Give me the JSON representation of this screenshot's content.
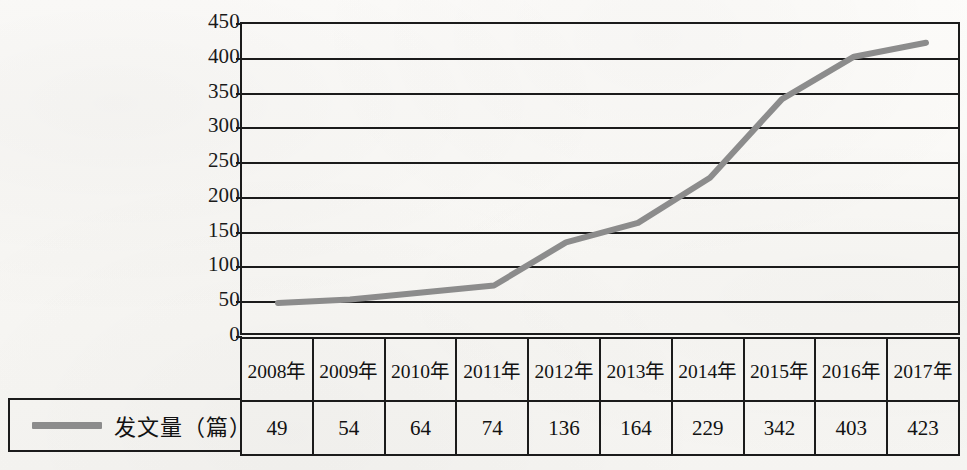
{
  "chart_data": {
    "type": "line",
    "title": "",
    "xlabel": "",
    "ylabel": "",
    "ylim": [
      0,
      450
    ],
    "ytick_step": 50,
    "grid": true,
    "legend_position": "bottom-left",
    "line_color": "#8c8c8c",
    "axis_color": "#1b1b1b",
    "series_name": "发文量（篇）",
    "categories": [
      "2008年",
      "2009年",
      "2010年",
      "2011年",
      "2012年",
      "2013年",
      "2014年",
      "2015年",
      "2016年",
      "2017年"
    ],
    "values": [
      49,
      54,
      64,
      74,
      136,
      164,
      229,
      342,
      403,
      423
    ],
    "yticks": [
      "450",
      "400",
      "350",
      "300",
      "250",
      "200",
      "150",
      "100",
      "50",
      "0"
    ],
    "series": [
      {
        "name": "发文量（篇）",
        "values": [
          49,
          54,
          64,
          74,
          136,
          164,
          229,
          342,
          403,
          423
        ]
      }
    ]
  },
  "legend": {
    "label": "发文量（篇）",
    "marker_color": "#8c8c8c"
  },
  "table": {
    "years": [
      "2008年",
      "2009年",
      "2010年",
      "2011年",
      "2012年",
      "2013年",
      "2014年",
      "2015年",
      "2016年",
      "2017年"
    ],
    "values": [
      "49",
      "54",
      "64",
      "74",
      "136",
      "164",
      "229",
      "342",
      "403",
      "423"
    ]
  }
}
